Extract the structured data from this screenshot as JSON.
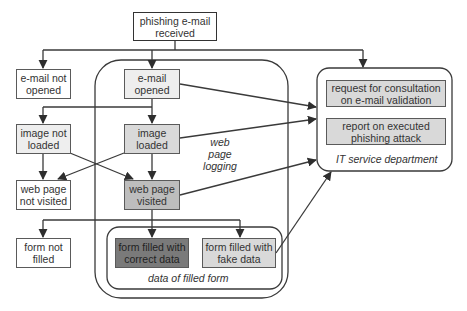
{
  "diagram": {
    "start": "phishing e-mail\nreceived",
    "left_column": {
      "email_not_opened": "e-mail not opened",
      "image_not_loaded": "image not loaded",
      "web_page_not_visited": "web page not visited",
      "form_not_filled": "form not filled"
    },
    "center_column": {
      "email_opened": "e-mail opened",
      "image_loaded": "image loaded",
      "web_page_visited": "web page visited",
      "form_correct": "form filled with correct data",
      "form_fake": "form filled with fake data"
    },
    "labels": {
      "web_page_logging": "web page logging",
      "data_of_filled_form": "data of filled form"
    },
    "it_department": {
      "title": "IT service department",
      "items": [
        "request for consultation on e-mail validation",
        "report on executed phishing attack"
      ]
    },
    "colors": {
      "line": "#3a3a3a",
      "box_border": "#5a5a5a",
      "fill_light": "#eeeeee",
      "fill_mid": "#d9d9d9",
      "fill_dark": "#bdbdbd",
      "fill_darkest": "#7a7a7a"
    }
  }
}
